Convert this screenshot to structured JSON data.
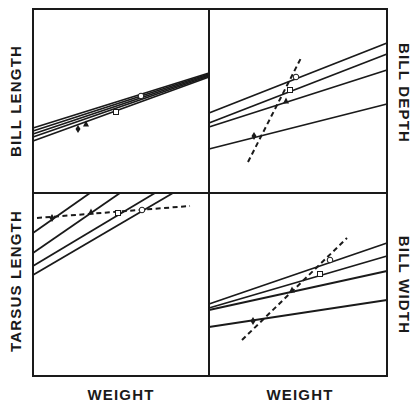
{
  "figure": {
    "ink_color": "#1a1a1a",
    "background": "#ffffff",
    "frame": {
      "x0": 33,
      "y0": 9,
      "x1": 387,
      "y1": 376,
      "xmid": 209,
      "ymid": 193
    }
  },
  "labels": {
    "top_left_y": "BILL LENGTH",
    "top_right_y": "BILL DEPTH",
    "bottom_left_y": "TARSUS LENGTH",
    "bottom_right_y": "BILL WIDTH",
    "x_left": "WEIGHT",
    "x_right": "WEIGHT"
  },
  "chart_data": [
    {
      "type": "line",
      "title": "",
      "panel": "top-left",
      "xlabel": "",
      "ylabel": "BILL LENGTH",
      "grid": false,
      "series": [
        {
          "name": "line-1",
          "style": "solid",
          "points": [
            [
              33,
              128
            ],
            [
              209,
              73
            ]
          ]
        },
        {
          "name": "line-2",
          "style": "solid",
          "points": [
            [
              33,
              131
            ],
            [
              209,
              74
            ]
          ]
        },
        {
          "name": "line-3",
          "style": "solid",
          "points": [
            [
              33,
              134
            ],
            [
              209,
              75
            ]
          ]
        },
        {
          "name": "line-4",
          "style": "solid",
          "points": [
            [
              33,
              137
            ],
            [
              209,
              76
            ]
          ]
        },
        {
          "name": "line-5",
          "style": "solid",
          "points": [
            [
              33,
              141
            ],
            [
              209,
              77
            ]
          ]
        }
      ],
      "markers": [
        {
          "shape": "diamond-filled",
          "x": 78,
          "y": 129
        },
        {
          "shape": "triangle-filled",
          "x": 86,
          "y": 124
        },
        {
          "shape": "square-open",
          "x": 116,
          "y": 112
        },
        {
          "shape": "circle-open",
          "x": 141,
          "y": 96
        }
      ]
    },
    {
      "type": "line",
      "title": "",
      "panel": "top-right",
      "xlabel": "",
      "ylabel": "BILL DEPTH",
      "grid": false,
      "series": [
        {
          "name": "line-1",
          "style": "solid",
          "points": [
            [
              209,
              113
            ],
            [
              387,
              43
            ]
          ]
        },
        {
          "name": "line-2",
          "style": "solid",
          "points": [
            [
              209,
              123
            ],
            [
              387,
              54
            ]
          ]
        },
        {
          "name": "line-3",
          "style": "solid",
          "points": [
            [
              209,
              127
            ],
            [
              387,
              70
            ]
          ]
        },
        {
          "name": "line-4",
          "style": "solid",
          "points": [
            [
              209,
              149
            ],
            [
              387,
              104
            ]
          ]
        },
        {
          "name": "trend",
          "style": "dashed",
          "points": [
            [
              248,
              162
            ],
            [
              302,
              56
            ]
          ]
        }
      ],
      "markers": [
        {
          "shape": "circle-open",
          "x": 296,
          "y": 77
        },
        {
          "shape": "square-open",
          "x": 290,
          "y": 90
        },
        {
          "shape": "triangle-filled",
          "x": 286,
          "y": 101
        },
        {
          "shape": "diamond-filled",
          "x": 254,
          "y": 136
        }
      ]
    },
    {
      "type": "line",
      "title": "",
      "panel": "bottom-left",
      "xlabel": "WEIGHT",
      "ylabel": "TARSUS LENGTH",
      "grid": false,
      "series": [
        {
          "name": "line-1",
          "style": "solid",
          "points": [
            [
              33,
              233
            ],
            [
              90,
              193
            ]
          ]
        },
        {
          "name": "line-2",
          "style": "solid",
          "points": [
            [
              33,
              253
            ],
            [
              120,
              193
            ]
          ]
        },
        {
          "name": "line-3",
          "style": "solid",
          "points": [
            [
              33,
              266
            ],
            [
              155,
              193
            ]
          ]
        },
        {
          "name": "line-4",
          "style": "solid",
          "points": [
            [
              33,
              275
            ],
            [
              173,
              193
            ]
          ]
        },
        {
          "name": "trend",
          "style": "dashed",
          "points": [
            [
              37,
              218
            ],
            [
              190,
              206
            ]
          ]
        }
      ],
      "markers": [
        {
          "shape": "diamond-filled",
          "x": 52,
          "y": 218
        },
        {
          "shape": "triangle-filled",
          "x": 91,
          "y": 212
        },
        {
          "shape": "square-open",
          "x": 118,
          "y": 213
        },
        {
          "shape": "circle-open",
          "x": 142,
          "y": 210
        }
      ]
    },
    {
      "type": "line",
      "title": "",
      "panel": "bottom-right",
      "xlabel": "WEIGHT",
      "ylabel": "BILL WIDTH",
      "grid": false,
      "series": [
        {
          "name": "line-1",
          "style": "solid",
          "points": [
            [
              209,
              304
            ],
            [
              387,
              243
            ]
          ]
        },
        {
          "name": "line-2",
          "style": "solid",
          "points": [
            [
              209,
              308
            ],
            [
              387,
              256
            ]
          ]
        },
        {
          "name": "line-3",
          "style": "solid",
          "points": [
            [
              209,
              310
            ],
            [
              387,
              271
            ]
          ]
        },
        {
          "name": "line-4",
          "style": "solid",
          "points": [
            [
              209,
              327
            ],
            [
              387,
              300
            ]
          ]
        },
        {
          "name": "trend",
          "style": "dashed",
          "points": [
            [
              242,
              340
            ],
            [
              347,
              238
            ]
          ]
        }
      ],
      "markers": [
        {
          "shape": "circle-open",
          "x": 330,
          "y": 260
        },
        {
          "shape": "square-open",
          "x": 320,
          "y": 274
        },
        {
          "shape": "triangle-filled",
          "x": 292,
          "y": 290
        },
        {
          "shape": "diamond-filled",
          "x": 253,
          "y": 321
        }
      ]
    }
  ]
}
